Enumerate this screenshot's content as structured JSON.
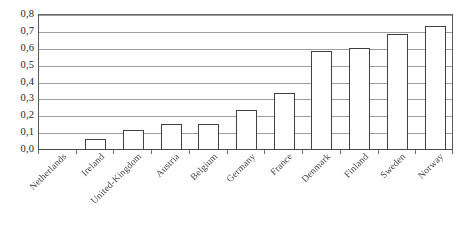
{
  "chart_data": {
    "type": "bar",
    "title": "",
    "subtitle": "",
    "xlabel": "",
    "ylabel": "",
    "categories": [
      "Netherlands",
      "Ireland",
      "United-Kingdom",
      "Austria",
      "Belgium",
      "Germany",
      "France",
      "Denmark",
      "Finland",
      "Sweden",
      "Norway"
    ],
    "values": [
      0.0,
      0.06,
      0.11,
      0.15,
      0.15,
      0.23,
      0.33,
      0.58,
      0.6,
      0.68,
      0.73
    ],
    "ylim": [
      0.0,
      0.8
    ],
    "ytick_values": [
      0.0,
      0.1,
      0.2,
      0.3,
      0.4,
      0.5,
      0.6,
      0.7,
      0.8
    ],
    "ytick_labels": [
      "0,0",
      "0,1",
      "0,2",
      "0,3",
      "0,4",
      "0,5",
      "0,6",
      "0,7",
      "0,8"
    ],
    "decimal_separator": ",",
    "grid": true,
    "grid_orientation": "horizontal",
    "legend": null,
    "legend_position": "none",
    "bar_fill_color": "#ffffff",
    "bar_border_color": "#404040",
    "gridline_color": "#9d9d9d",
    "axis_color": "#4a4a4a",
    "background_color": "#ffffff",
    "xtick_label_rotation": -45
  }
}
